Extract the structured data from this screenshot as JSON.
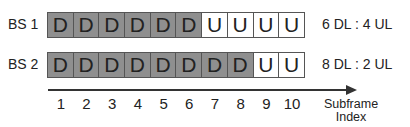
{
  "rows": [
    {
      "label": "BS 1",
      "cells": [
        "D",
        "D",
        "D",
        "D",
        "D",
        "D",
        "U",
        "U",
        "U",
        "U"
      ],
      "ratio": "6 DL : 4 UL"
    },
    {
      "label": "BS 2",
      "cells": [
        "D",
        "D",
        "D",
        "D",
        "D",
        "D",
        "D",
        "D",
        "U",
        "U"
      ],
      "ratio": "8 DL : 2 UL"
    }
  ],
  "axis": {
    "ticks": [
      "1",
      "2",
      "3",
      "4",
      "5",
      "6",
      "7",
      "8",
      "9",
      "10"
    ],
    "label_line1": "Subframe",
    "label_line2": "Index"
  },
  "colors": {
    "downlink": "#8f8f8f",
    "uplink": "#ffffff",
    "border": "#555555"
  }
}
